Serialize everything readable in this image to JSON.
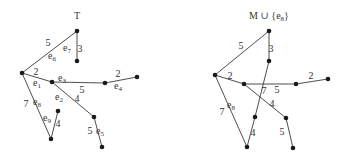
{
  "diagrams": [
    {
      "title": "T",
      "title_pos": [
        77,
        19
      ],
      "nodes": [
        {
          "id": "a",
          "x": 77,
          "y": 31
        },
        {
          "id": "b",
          "x": 77,
          "y": 61
        },
        {
          "id": "c",
          "x": 22,
          "y": 73
        },
        {
          "id": "d",
          "x": 52,
          "y": 82
        },
        {
          "id": "e",
          "x": 105,
          "y": 83
        },
        {
          "id": "f",
          "x": 137,
          "y": 77
        },
        {
          "id": "g",
          "x": 94,
          "y": 117
        },
        {
          "id": "h",
          "x": 102,
          "y": 147
        },
        {
          "id": "i",
          "x": 51,
          "y": 139
        },
        {
          "id": "j",
          "x": 58,
          "y": 111
        }
      ],
      "edges": [
        {
          "name": "e6",
          "from": "c",
          "to": "a",
          "weight": "5"
        },
        {
          "name": "e7",
          "from": "a",
          "to": "b",
          "weight": "3"
        },
        {
          "name": "e1",
          "from": "c",
          "to": "d",
          "weight": "2"
        },
        {
          "name": "e3",
          "from": "d",
          "to": "e",
          "weight": "5"
        },
        {
          "name": "e4",
          "from": "e",
          "to": "f",
          "weight": "2"
        },
        {
          "name": "e2",
          "from": "d",
          "to": "g",
          "weight": "4"
        },
        {
          "name": "e5",
          "from": "g",
          "to": "h",
          "weight": "5"
        },
        {
          "name": "e8",
          "from": "c",
          "to": "i",
          "weight": "7"
        },
        {
          "name": "e9",
          "from": "i",
          "to": "j",
          "weight": "4"
        }
      ],
      "labels": [
        {
          "text": "5",
          "x": 48,
          "y": 46
        },
        {
          "text": "e6",
          "x": 52,
          "y": 59
        },
        {
          "text": "e7",
          "x": 67,
          "y": 51
        },
        {
          "text": "3",
          "x": 80,
          "y": 52
        },
        {
          "text": "2",
          "x": 36,
          "y": 75
        },
        {
          "text": "e1",
          "x": 37,
          "y": 86
        },
        {
          "text": "e3",
          "x": 62,
          "y": 81
        },
        {
          "text": "5",
          "x": 82,
          "y": 93
        },
        {
          "text": "2",
          "x": 118,
          "y": 77
        },
        {
          "text": "e4",
          "x": 118,
          "y": 89
        },
        {
          "text": "e2",
          "x": 59,
          "y": 100
        },
        {
          "text": "4",
          "x": 77,
          "y": 102
        },
        {
          "text": "7",
          "x": 26,
          "y": 107
        },
        {
          "text": "e8",
          "x": 37,
          "y": 105
        },
        {
          "text": "e9",
          "x": 47,
          "y": 121
        },
        {
          "text": "4",
          "x": 58,
          "y": 127
        },
        {
          "text": "5",
          "x": 90,
          "y": 134
        },
        {
          "text": "e5",
          "x": 100,
          "y": 134
        }
      ]
    },
    {
      "title": "M ∪ {e8}",
      "title_pos": [
        269,
        19
      ],
      "nodes": [
        {
          "id": "a",
          "x": 269,
          "y": 31
        },
        {
          "id": "b",
          "x": 269,
          "y": 61
        },
        {
          "id": "c",
          "x": 215,
          "y": 75
        },
        {
          "id": "d",
          "x": 244,
          "y": 84
        },
        {
          "id": "e",
          "x": 296,
          "y": 84
        },
        {
          "id": "f",
          "x": 328,
          "y": 79
        },
        {
          "id": "g",
          "x": 286,
          "y": 118
        },
        {
          "id": "h",
          "x": 293,
          "y": 148
        },
        {
          "id": "i",
          "x": 247,
          "y": 147
        },
        {
          "id": "j",
          "x": 255,
          "y": 117
        }
      ],
      "edges": [
        {
          "from": "c",
          "to": "a",
          "weight": "5"
        },
        {
          "from": "a",
          "to": "b",
          "weight": "3"
        },
        {
          "from": "c",
          "to": "d",
          "weight": "2"
        },
        {
          "from": "d",
          "to": "e",
          "weight": "5"
        },
        {
          "from": "e",
          "to": "f",
          "weight": "2"
        },
        {
          "from": "d",
          "to": "g",
          "weight": "4"
        },
        {
          "from": "g",
          "to": "h",
          "weight": "5"
        },
        {
          "from": "c",
          "to": "i",
          "weight": "7"
        },
        {
          "from": "i",
          "to": "j",
          "weight": "4"
        },
        {
          "from": "j",
          "to": "b",
          "weight": "7"
        }
      ],
      "labels": [
        {
          "text": "5",
          "x": 241,
          "y": 49
        },
        {
          "text": "3",
          "x": 271,
          "y": 52
        },
        {
          "text": "2",
          "x": 230,
          "y": 79
        },
        {
          "text": "7",
          "x": 264,
          "y": 94
        },
        {
          "text": "5",
          "x": 277,
          "y": 93
        },
        {
          "text": "2",
          "x": 311,
          "y": 79
        },
        {
          "text": "4",
          "x": 272,
          "y": 107
        },
        {
          "text": "e8",
          "x": 231,
          "y": 108
        },
        {
          "text": "7",
          "x": 222,
          "y": 115
        },
        {
          "text": "4",
          "x": 253,
          "y": 136
        },
        {
          "text": "5",
          "x": 282,
          "y": 135
        }
      ]
    }
  ]
}
